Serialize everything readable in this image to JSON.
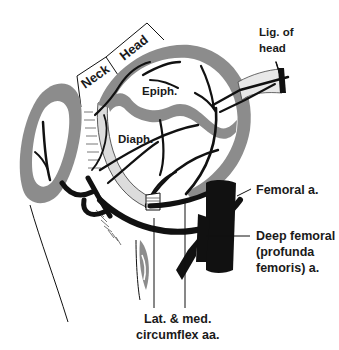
{
  "diagram": {
    "brackets": {
      "neck": "Neck",
      "head": "Head"
    },
    "regions": {
      "epiphysis": "Epiph.",
      "diaphysis": "Diaph."
    },
    "callouts": {
      "ligament_line1": "Lig. of",
      "ligament_line2": "head",
      "femoral": "Femoral a.",
      "deep_femoral_line1": "Deep femoral",
      "deep_femoral_line2": "(profunda",
      "deep_femoral_line3": "femoris) a.",
      "circumflex_line1": "Lat. & med.",
      "circumflex_line2": "circumflex aa."
    },
    "colors": {
      "cartilage_gray": "#8c8c8c",
      "vessel_black": "#111111",
      "ligament_light": "#e4e4e4",
      "background": "#ffffff"
    }
  }
}
